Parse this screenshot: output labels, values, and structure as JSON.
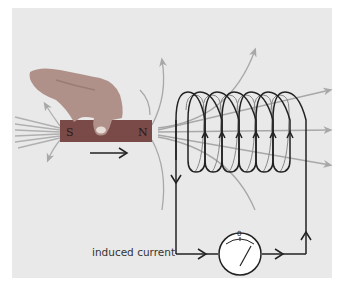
{
  "diagram": {
    "magnet": {
      "south_label": "S",
      "north_label": "N",
      "color": "#7a4a48",
      "motion_direction": "right"
    },
    "coil": {
      "turns": 6,
      "wire_color": "#222222"
    },
    "field_lines_color": "#a8a8a8",
    "galvanometer": {
      "scale_zero_label": "0"
    },
    "labels": {
      "induced_current": "induced current"
    },
    "colors": {
      "background_panel": "#e9e9e9",
      "page": "#ffffff",
      "hand": "#b89a88"
    }
  }
}
